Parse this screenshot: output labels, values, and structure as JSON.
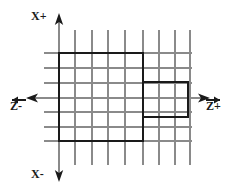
{
  "diagram": {
    "type": "technical-line-drawing",
    "colors": {
      "background": "#ffffff",
      "grid": "#8a8a8a",
      "axis": "#8a8a8a",
      "outline": "#1a1a1a",
      "text": "#1a1a1a"
    },
    "axes": {
      "vertical": {
        "name": "X",
        "positive_label": "X+",
        "negative_label": "X-",
        "positive_direction": "up",
        "negative_direction": "down",
        "x": 59,
        "y_top": 15,
        "y_bottom": 180
      },
      "horizontal": {
        "name": "Z",
        "positive_label": "Z+",
        "negative_label": "Z-",
        "positive_direction": "right",
        "negative_direction": "left",
        "y": 98,
        "x_left": 28,
        "x_right": 208
      },
      "origin": {
        "x": 59,
        "y": 98
      }
    },
    "grid": {
      "vertical_lines_x": [
        59,
        75,
        92,
        108,
        125,
        143,
        159,
        175,
        190
      ],
      "vertical_extent": {
        "y_top": 30,
        "y_bottom": 165
      },
      "horizontal_lines_y": [
        53,
        68,
        83,
        98,
        112,
        127,
        141
      ],
      "horizontal_extent": {
        "x_left": 44,
        "x_right": 192
      },
      "columns": 8,
      "rows": 6
    },
    "shapes": [
      {
        "name": "main-region",
        "kind": "rectangle",
        "x1": 59,
        "y1": 53,
        "x2": 143,
        "y2": 141,
        "stroke_width": 2.4
      },
      {
        "name": "tab-region",
        "kind": "rectangle",
        "x1": 143,
        "y1": 82,
        "x2": 188,
        "y2": 117,
        "stroke_width": 2.4
      }
    ]
  },
  "labels": {
    "x_positive": "X+",
    "x_negative": "X-",
    "z_positive": "Z+",
    "z_negative": "Z-"
  }
}
